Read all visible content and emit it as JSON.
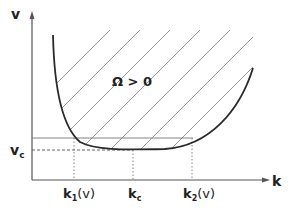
{
  "axes": {
    "y_label": "v",
    "x_label": "k"
  },
  "labels": {
    "region": "Ω > 0",
    "vc": "v",
    "vc_sub": "c",
    "k1": "k",
    "k1_sub": "1",
    "k1_arg": "(v)",
    "kc": "k",
    "kc_sub": "c",
    "k2": "k",
    "k2_sub": "2",
    "k2_arg": "(v)"
  },
  "colors": {
    "curve": "#2a2a2a",
    "hatch": "#8a8a8a",
    "axis": "#555555"
  }
}
